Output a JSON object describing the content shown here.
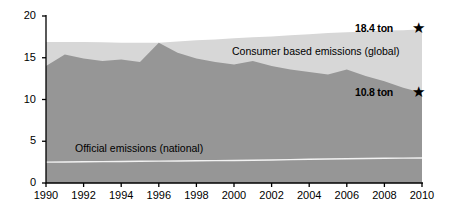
{
  "chart_data": {
    "type": "area",
    "title": "",
    "xlabel": "",
    "ylabel": "",
    "xlim": [
      1990,
      2010
    ],
    "ylim": [
      0,
      20
    ],
    "yticks": [
      0,
      5,
      10,
      15,
      20
    ],
    "xticks": [
      1990,
      1992,
      1994,
      1996,
      1998,
      2000,
      2002,
      2004,
      2006,
      2008,
      2010
    ],
    "grid": false,
    "legend_position": "inline-annotations",
    "x": [
      1990,
      1991,
      1992,
      1993,
      1994,
      1995,
      1996,
      1997,
      1998,
      1999,
      2000,
      2001,
      2002,
      2003,
      2004,
      2005,
      2006,
      2007,
      2008,
      2009,
      2010
    ],
    "series": [
      {
        "name": "Consumer based emissions (global)",
        "type": "area-top",
        "color": "#d7d7d7",
        "values": [
          16.9,
          16.9,
          16.9,
          16.85,
          16.8,
          16.8,
          16.8,
          16.95,
          17.1,
          17.2,
          17.35,
          17.45,
          17.55,
          17.7,
          17.8,
          17.95,
          18.05,
          18.15,
          18.25,
          18.3,
          18.4
        ]
      },
      {
        "name": "Official emissions (national)",
        "type": "area-fill",
        "color": "#969696",
        "values": [
          14.0,
          15.4,
          14.9,
          14.6,
          14.8,
          14.5,
          16.8,
          15.6,
          14.9,
          14.5,
          14.2,
          14.6,
          14.0,
          13.6,
          13.3,
          13.0,
          13.6,
          12.8,
          12.2,
          11.4,
          10.8
        ]
      },
      {
        "name": "official-line",
        "type": "line",
        "color": "#f2f2f2",
        "values": [
          2.5,
          2.52,
          2.54,
          2.56,
          2.58,
          2.6,
          2.62,
          2.64,
          2.66,
          2.68,
          2.7,
          2.72,
          2.76,
          2.8,
          2.84,
          2.88,
          2.9,
          2.93,
          2.96,
          2.98,
          3.0
        ]
      }
    ],
    "annotations": [
      {
        "name": "consumer-callout",
        "text": "18.4 ton",
        "value": 18.4,
        "year": 2010,
        "marker": "star"
      },
      {
        "name": "dark-callout",
        "text": "10.8 ton",
        "value": 10.8,
        "year": 2010,
        "marker": "star"
      }
    ],
    "inline_labels": [
      {
        "name": "consumer-label",
        "text": "Consumer based emissions (global)"
      },
      {
        "name": "official-label",
        "text": "Official emissions (national)"
      }
    ]
  },
  "labels": {
    "consumer_series": "Consumer based emissions (global)",
    "official_series": "Official emissions (national)",
    "callout_consumer": "18.4 ton",
    "callout_official": "10.8 ton",
    "star_glyph": "★"
  },
  "axis": {
    "y_ticks": [
      "0",
      "5",
      "10",
      "15",
      "20"
    ],
    "x_ticks": [
      "1990",
      "1992",
      "1994",
      "1996",
      "1998",
      "2000",
      "2002",
      "2004",
      "2006",
      "2008",
      "2010"
    ]
  },
  "colors": {
    "consumer_fill": "#d7d7d7",
    "official_fill": "#969696",
    "official_line": "#f2f2f2",
    "axis": "#000000"
  }
}
